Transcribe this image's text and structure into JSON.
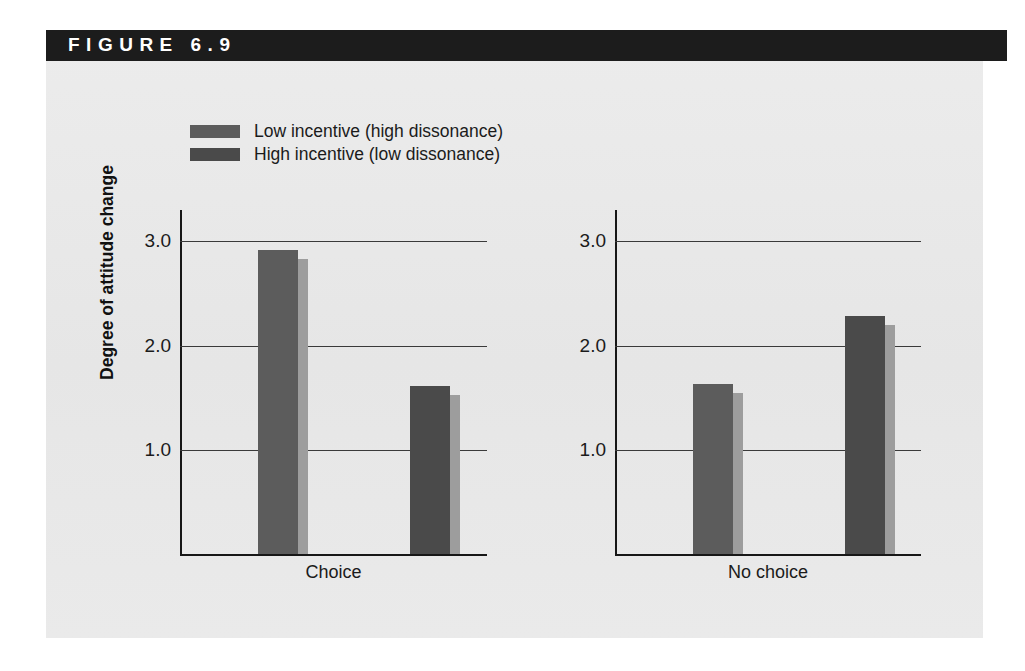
{
  "figure": {
    "header_label": "FIGURE  6.9",
    "header_bg": "#1c1c1c",
    "header_fg": "#ffffff",
    "panel_bg": "#e9e9e9"
  },
  "legend": {
    "items": [
      {
        "label": "Low incentive (high dissonance)",
        "color": "#5c5c5c",
        "shade": "#9d9d9d"
      },
      {
        "label": "High incentive (low dissonance)",
        "color": "#4a4a4a",
        "shade": "#9d9d9d"
      }
    ]
  },
  "axis": {
    "ylabel": "Degree of attitude change",
    "yticks": [
      "3.0",
      "2.0",
      "1.0"
    ],
    "ytick_values": [
      3.0,
      2.0,
      1.0
    ]
  },
  "chart_data": {
    "type": "bar",
    "title": "FIGURE  6.9",
    "xlabel": "",
    "ylabel": "Degree of attitude change",
    "ylim": [
      0,
      3.3
    ],
    "grid": true,
    "legend_position": "top-left",
    "categories": [
      "Choice",
      "No choice"
    ],
    "series": [
      {
        "name": "Low incentive (high dissonance)",
        "color": "#5c5c5c",
        "values": [
          2.91,
          1.63
        ]
      },
      {
        "name": "High incentive (low dissonance)",
        "color": "#4a4a4a",
        "values": [
          1.61,
          2.28
        ]
      }
    ],
    "panels": [
      {
        "label": "Choice",
        "bars": [
          {
            "series": "Low incentive (high dissonance)",
            "value": 2.91
          },
          {
            "series": "High incentive (low dissonance)",
            "value": 1.61
          }
        ]
      },
      {
        "label": "No choice",
        "bars": [
          {
            "series": "Low incentive (high dissonance)",
            "value": 1.63
          },
          {
            "series": "High incentive (low dissonance)",
            "value": 2.28
          }
        ]
      }
    ]
  }
}
